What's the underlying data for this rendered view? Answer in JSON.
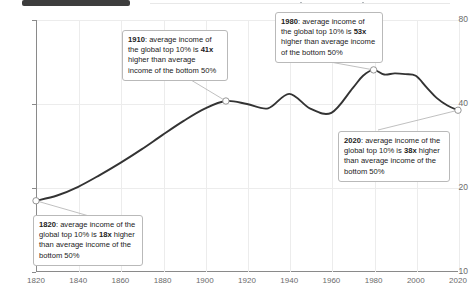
{
  "chrome": {
    "pill_label": "",
    "dots": [
      "dot-1",
      "dot-2"
    ]
  },
  "chart_data": {
    "type": "line",
    "title": "",
    "xlabel": "",
    "ylabel": "Ratio of top 10% average income to bottom 50% average income",
    "yscale": "log",
    "ylim": [
      10,
      80
    ],
    "xlim": [
      1820,
      2020
    ],
    "yticks": [
      10,
      20,
      40,
      80
    ],
    "ytick_labels": [
      "10",
      "20",
      "40",
      "80"
    ],
    "xticks": [
      1820,
      1840,
      1860,
      1880,
      1900,
      1920,
      1940,
      1960,
      1980,
      2000,
      2020
    ],
    "xtick_labels": [
      "1820",
      "1840",
      "1860",
      "1880",
      "1900",
      "1920",
      "1940",
      "1960",
      "1980",
      "2000",
      "2020"
    ],
    "grid": "both",
    "legend": "none",
    "line_color": "#333333",
    "series": [
      {
        "name": "Ratio of top 10% to bottom 50% average income",
        "x": [
          1820,
          1830,
          1840,
          1850,
          1860,
          1870,
          1880,
          1890,
          1900,
          1910,
          1920,
          1930,
          1940,
          1950,
          1960,
          1970,
          1975,
          1980,
          1985,
          1990,
          1995,
          2000,
          2005,
          2010,
          2015,
          2020
        ],
        "values": [
          18,
          18.8,
          20.2,
          22.2,
          24.6,
          27.5,
          31,
          34.8,
          38.5,
          41,
          40,
          38.6,
          43.5,
          38.5,
          37.2,
          45.5,
          50.5,
          53,
          51,
          51.5,
          51.2,
          50.5,
          46,
          42,
          39.5,
          38
        ]
      }
    ],
    "markers": [
      {
        "name": "marker-1820",
        "x": 1820,
        "y": 18
      },
      {
        "name": "marker-1910",
        "x": 1910,
        "y": 41
      },
      {
        "name": "marker-1980",
        "x": 1980,
        "y": 53
      },
      {
        "name": "marker-2020",
        "x": 2020,
        "y": 38
      }
    ],
    "annotations": [
      {
        "id": "annotation-1820",
        "year": "1820",
        "lead": "1820",
        "text_before": ": average income of the global top 10% is ",
        "value": "18x",
        "text_after": " higher than average income of the bottom 50%"
      },
      {
        "id": "annotation-1910",
        "year": "1910",
        "lead": "1910",
        "text_before": ": average income of the global top 10% is ",
        "value": "41x",
        "text_after": " higher than average income of the bottom 50%"
      },
      {
        "id": "annotation-1980",
        "year": "1980",
        "lead": "1980",
        "text_before": ": average income of the global top 10% is ",
        "value": "53x",
        "text_after": " higher than average income of the bottom 50%"
      },
      {
        "id": "annotation-2020",
        "year": "2020",
        "lead": "2020",
        "text_before": ": average income of the global top 10% is ",
        "value": "38x",
        "text_after": " higher than average income of the bottom 50%"
      }
    ]
  }
}
